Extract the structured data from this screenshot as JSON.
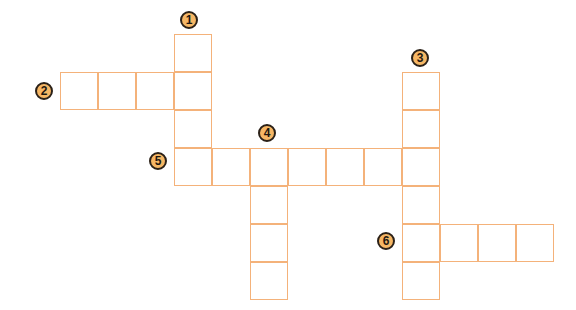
{
  "puzzle": {
    "type": "crossword",
    "cell_size": 38,
    "colors": {
      "cell_border": "#f4b27a",
      "badge_fill": "#f6b765",
      "badge_outline": "#2b2118"
    },
    "clues": [
      {
        "number": "1",
        "direction": "down",
        "length": 4,
        "start": [
          174,
          34
        ],
        "badge": [
          180,
          11
        ]
      },
      {
        "number": "2",
        "direction": "across",
        "length": 4,
        "start": [
          60,
          72
        ],
        "badge": [
          35,
          82
        ]
      },
      {
        "number": "3",
        "direction": "down",
        "length": 6,
        "start": [
          402,
          72
        ],
        "badge": [
          411,
          49
        ]
      },
      {
        "number": "4",
        "direction": "down",
        "length": 4,
        "start": [
          250,
          148
        ],
        "badge": [
          258,
          124
        ]
      },
      {
        "number": "5",
        "direction": "across",
        "length": 7,
        "start": [
          174,
          148
        ],
        "badge": [
          149,
          152
        ]
      },
      {
        "number": "6",
        "direction": "across",
        "length": 4,
        "start": [
          402,
          224
        ],
        "badge": [
          377,
          232
        ]
      }
    ]
  }
}
